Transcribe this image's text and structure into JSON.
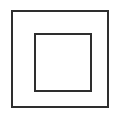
{
  "canvas": {
    "width": 120,
    "height": 116,
    "background_color": "#ffffff",
    "title": "Square in square outline symbol"
  },
  "figure": {
    "name": "concentric-squares",
    "description": "Two concentric unfilled squares drawn as thin dark outlines on a white background",
    "stroke_color": "#2e2e2e",
    "fill_color": "none",
    "shape_count": 2
  },
  "shapes": [
    {
      "id": "outer-square",
      "label": "Outer square",
      "type": "square",
      "x": 11,
      "y": 10,
      "width": 98,
      "height": 98,
      "stroke_width": 1.6,
      "stroke_color": "#2e2e2e",
      "fill": "none"
    },
    {
      "id": "inner-square",
      "label": "Inner square",
      "type": "square",
      "x": 34,
      "y": 33,
      "width": 58,
      "height": 59,
      "stroke_width": 1.8,
      "stroke_color": "#2e2e2e",
      "fill": "none"
    }
  ]
}
